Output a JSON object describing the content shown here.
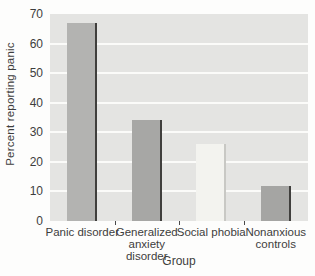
{
  "chart_data": {
    "type": "bar",
    "title": "",
    "xlabel": "Group",
    "ylabel": "Percent reporting panic",
    "categories": [
      "Panic disorder",
      "Generalized anxiety disorder",
      "Social phobia",
      "Nonanxious controls"
    ],
    "values": [
      67,
      34,
      26,
      12
    ],
    "ylim": [
      0,
      70
    ],
    "y_ticks": [
      0,
      10,
      20,
      30,
      40,
      50,
      60,
      70
    ],
    "gridline_values": [
      10,
      20,
      30,
      40,
      50,
      60
    ],
    "grid": "horizontal white gridlines on light gray plot background",
    "legend": "none",
    "bar_colors": [
      "#b3b3b1",
      "#a7a7a5",
      "#f3f3ef",
      "#a5a5a3"
    ],
    "bar_edge_colors": [
      "#403f3d",
      "#403f3d",
      "#c8c8c4",
      "#403f3d"
    ]
  },
  "colors": {
    "figure_bg": "#fdfdfc",
    "plot_bg": "#e4e4e2",
    "gridline": "#fbfbf9",
    "text": "#3d3d3d",
    "axis_tick": "#4a4a4a"
  }
}
